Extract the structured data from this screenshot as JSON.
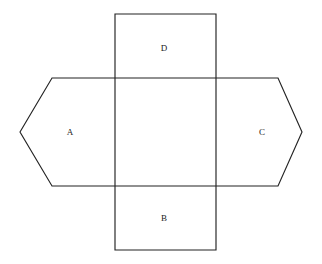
{
  "figure": {
    "type": "geometric-net-diagram",
    "background_color": "#ffffff",
    "stroke_color": "#232323",
    "stroke_width": 1.15,
    "label_color": "#1a1a1a",
    "canvas": {
      "width": 322,
      "height": 264
    },
    "shapes": {
      "hexagon": {
        "name": "horizontal-hexagon",
        "points": "20,132 52,78 278,78 302,132 278,186 52,186",
        "vertices": [
          {
            "x": 20,
            "y": 132
          },
          {
            "x": 52,
            "y": 78
          },
          {
            "x": 278,
            "y": 78
          },
          {
            "x": 302,
            "y": 132
          },
          {
            "x": 278,
            "y": 186
          },
          {
            "x": 52,
            "y": 186
          }
        ]
      },
      "rectangle": {
        "name": "vertical-rectangle",
        "x": 115,
        "y": 14,
        "width": 101,
        "height": 236,
        "points": "115,14 216,14 216,250 115,250"
      }
    },
    "labels": [
      {
        "id": "label-a",
        "text": "A",
        "x": 70,
        "y": 132
      },
      {
        "id": "label-b",
        "text": "B",
        "x": 164,
        "y": 218
      },
      {
        "id": "label-c",
        "text": "C",
        "x": 262,
        "y": 132
      },
      {
        "id": "label-d",
        "text": "D",
        "x": 164,
        "y": 48
      }
    ]
  }
}
